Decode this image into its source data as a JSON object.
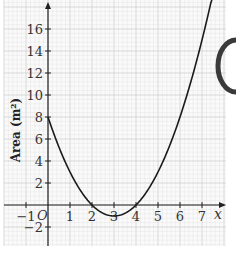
{
  "chart_data": {
    "type": "line",
    "title": "",
    "xlabel": "x",
    "ylabel": "Area (m²)",
    "function": "A = x^2 - 6x + 8",
    "x_ticks": [
      -1,
      1,
      2,
      3,
      4,
      5,
      6,
      7
    ],
    "y_ticks": [
      -2,
      2,
      4,
      6,
      8,
      10,
      12,
      14,
      16
    ],
    "xlim": [
      -1.9,
      8.1
    ],
    "ylim": [
      -3.7,
      18.6
    ],
    "origin_label": "O",
    "grid": true,
    "series": [
      {
        "name": "Area",
        "x": [
          0,
          0.5,
          1,
          1.5,
          2,
          2.5,
          3,
          3.5,
          4,
          4.5,
          5,
          5.5,
          6,
          6.5,
          7,
          7.5
        ],
        "values": [
          8,
          5.25,
          3,
          1.25,
          0,
          -0.75,
          -1,
          -0.75,
          0,
          1.25,
          3,
          5.25,
          8,
          11.25,
          15,
          19.25
        ]
      }
    ]
  },
  "labels": {
    "ylabel": "Area (m²)",
    "xlabel": "x",
    "origin": "O"
  },
  "colors": {
    "grid_minor": "#e4e4e4",
    "grid_major": "#cfcfcf",
    "axis": "#222222",
    "curve": "#1a1a1a"
  }
}
